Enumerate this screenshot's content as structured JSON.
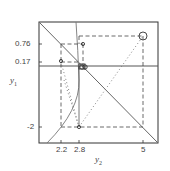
{
  "diagram": {
    "type": "phase-plot",
    "x_axis": {
      "label": "y",
      "label_sub": "2",
      "ticks": [
        "2.2",
        "2.8",
        "5"
      ]
    },
    "y_axis": {
      "label": "y",
      "label_sub": "1",
      "ticks": [
        "0.76",
        "0.17",
        "-2"
      ]
    },
    "elements": {
      "diagonal_line": "y1 = -y2 style decreasing line",
      "horizontal_line": "solid line near y1 ≈ 0",
      "curve": "concave curve from bottom-left to top",
      "dashed_rectangles": 2,
      "dotted_paths": 2,
      "markers": [
        {
          "shape": "circle-large",
          "at": "y2=5, top"
        },
        {
          "shape": "circle",
          "at": "y2=2.8, y1=0.76"
        },
        {
          "shape": "circle",
          "at": "y2=2.2, y1=0.17"
        },
        {
          "shape": "circle",
          "at": "y2=2.8, y1=-2"
        },
        {
          "shape": "circle-cluster",
          "at": "y2≈2.9, y1≈0"
        }
      ]
    },
    "colors": {
      "line": "#555555",
      "frame": "#333333",
      "background": "#ffffff"
    }
  }
}
